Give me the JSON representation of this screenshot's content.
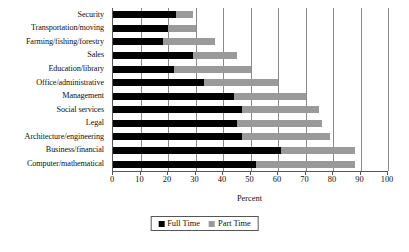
{
  "chart_data": {
    "type": "bar",
    "orientation": "horizontal",
    "stacked": true,
    "title": "",
    "xlabel": "Percent",
    "ylabel": "",
    "xlim": [
      0,
      100
    ],
    "xticks": [
      0,
      10,
      20,
      30,
      40,
      50,
      60,
      70,
      80,
      90,
      100
    ],
    "grid": "vertical",
    "legend_position": "bottom-center",
    "categories": [
      "Security",
      "Transportation/moving",
      "Farming/fishing/forestry",
      "Sales",
      "Education/library",
      "Office/administrative",
      "Management",
      "Social services",
      "Legal",
      "Architecture/engineering",
      "Business/financial",
      "Computer/mathematical"
    ],
    "series": [
      {
        "name": "Full Time",
        "color": "#000000",
        "values": [
          23,
          20,
          18,
          29,
          22,
          33,
          44,
          47,
          45,
          47,
          61,
          52
        ]
      },
      {
        "name": "Part Time",
        "color": "#9a9a9a",
        "values": [
          6,
          10,
          19,
          16,
          28,
          27,
          26,
          28,
          31,
          32,
          27,
          36
        ]
      }
    ]
  },
  "legend": {
    "items": [
      {
        "label": "Full Time",
        "swatch": "full"
      },
      {
        "label": "Part Time",
        "swatch": "part"
      }
    ]
  },
  "axis": {
    "x_title": "Percent"
  }
}
